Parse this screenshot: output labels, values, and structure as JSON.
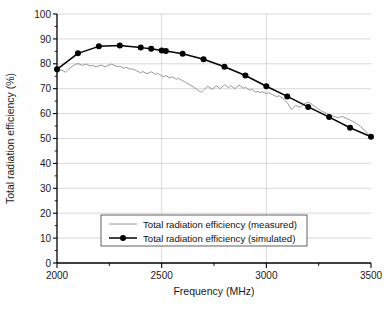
{
  "chart_data": {
    "type": "line",
    "title": "",
    "xlabel": "Frequency (MHz)",
    "ylabel": "Total radiation efficiency (%)",
    "xlim": [
      2000,
      3500
    ],
    "ylim": [
      0,
      100
    ],
    "grid": true,
    "legend_position": "lower-center",
    "x_ticks": [
      2000,
      2500,
      3000,
      3500
    ],
    "x_tick_labels": [
      "2000",
      "2500",
      "3000",
      "3500"
    ],
    "x_minor_ticks": [
      2250,
      2750,
      3250
    ],
    "y_ticks": [
      0,
      10,
      20,
      30,
      40,
      50,
      60,
      70,
      80,
      90,
      100
    ],
    "y_tick_labels": [
      "0",
      "10",
      "20",
      "30",
      "40",
      "50",
      "60",
      "70",
      "80",
      "90",
      "100"
    ],
    "series": [
      {
        "name": "Total radiation efficiency (measured)",
        "color": "#8a8a8a",
        "style": "line",
        "marker": "none",
        "x": [
          2000,
          2010,
          2020,
          2030,
          2040,
          2050,
          2060,
          2070,
          2080,
          2090,
          2100,
          2110,
          2120,
          2130,
          2140,
          2150,
          2160,
          2170,
          2180,
          2190,
          2200,
          2210,
          2220,
          2230,
          2240,
          2250,
          2260,
          2270,
          2280,
          2290,
          2300,
          2310,
          2320,
          2330,
          2340,
          2350,
          2360,
          2370,
          2380,
          2390,
          2400,
          2410,
          2420,
          2430,
          2440,
          2450,
          2460,
          2470,
          2480,
          2490,
          2500,
          2510,
          2520,
          2530,
          2540,
          2550,
          2560,
          2570,
          2580,
          2590,
          2600,
          2610,
          2620,
          2630,
          2640,
          2650,
          2660,
          2670,
          2680,
          2690,
          2700,
          2710,
          2720,
          2730,
          2740,
          2750,
          2760,
          2770,
          2780,
          2790,
          2800,
          2810,
          2820,
          2830,
          2840,
          2850,
          2860,
          2870,
          2880,
          2890,
          2900,
          2910,
          2920,
          2930,
          2940,
          2950,
          2960,
          2970,
          2980,
          2990,
          3000,
          3010,
          3020,
          3030,
          3040,
          3050,
          3060,
          3070,
          3080,
          3090,
          3100,
          3110,
          3120,
          3130,
          3140,
          3150,
          3160,
          3170,
          3180,
          3190,
          3200,
          3210,
          3220,
          3230,
          3240,
          3250,
          3260,
          3270,
          3280,
          3290,
          3300,
          3310,
          3320,
          3330,
          3340,
          3350,
          3360,
          3370,
          3380,
          3390,
          3400,
          3410,
          3420,
          3430,
          3440,
          3450,
          3460,
          3470,
          3480,
          3490,
          3500
        ],
        "values": [
          76.2,
          77.0,
          77.6,
          77.2,
          76.6,
          77.4,
          78.2,
          78.8,
          79.4,
          79.8,
          80.1,
          79.8,
          79.4,
          79.6,
          79.9,
          79.5,
          79.1,
          79.4,
          79.0,
          78.8,
          79.2,
          79.5,
          79.1,
          78.8,
          79.2,
          79.6,
          79.9,
          79.5,
          79.2,
          78.8,
          79.0,
          78.6,
          78.2,
          78.6,
          78.2,
          77.8,
          78.0,
          77.6,
          77.2,
          76.8,
          76.4,
          76.9,
          76.4,
          76.0,
          76.4,
          76.8,
          76.3,
          75.8,
          76.2,
          75.7,
          75.2,
          74.8,
          75.2,
          74.8,
          74.3,
          74.8,
          74.3,
          73.8,
          74.2,
          73.7,
          73.2,
          72.8,
          72.3,
          71.8,
          71.3,
          70.8,
          70.2,
          69.6,
          69.0,
          68.6,
          69.4,
          70.2,
          71.0,
          70.4,
          69.8,
          70.4,
          71.2,
          70.6,
          70.0,
          70.8,
          71.6,
          71.0,
          70.4,
          71.2,
          70.6,
          70.0,
          70.8,
          71.4,
          70.8,
          70.2,
          70.6,
          70.0,
          69.4,
          69.8,
          69.2,
          68.6,
          69.0,
          68.4,
          68.8,
          68.4,
          68.0,
          68.4,
          68.0,
          67.6,
          67.2,
          66.8,
          67.2,
          66.6,
          66.0,
          65.2,
          64.4,
          63.0,
          61.6,
          62.4,
          63.2,
          63.0,
          62.6,
          63.2,
          63.8,
          64.2,
          64.6,
          64.2,
          63.6,
          63.0,
          62.4,
          61.8,
          61.2,
          60.8,
          60.4,
          60.0,
          59.6,
          59.2,
          58.9,
          58.6,
          58.4,
          58.6,
          58.8,
          58.6,
          58.2,
          57.8,
          57.4,
          57.0,
          56.6,
          56.0,
          55.4,
          54.8,
          54.0,
          53.2,
          52.4,
          51.6,
          50.9
        ]
      },
      {
        "name": "Total radiation efficiency (simulated)",
        "color": "#000000",
        "style": "line",
        "marker": "circle",
        "x": [
          2000,
          2100,
          2200,
          2300,
          2400,
          2450,
          2500,
          2520,
          2600,
          2700,
          2800,
          2900,
          3000,
          3100,
          3200,
          3300,
          3400,
          3500
        ],
        "values": [
          77.8,
          84.2,
          87.0,
          87.3,
          86.5,
          86.0,
          85.3,
          85.1,
          84.0,
          81.8,
          78.8,
          75.3,
          71.0,
          66.9,
          62.7,
          58.6,
          54.3,
          50.7
        ]
      }
    ]
  },
  "legend": {
    "items": [
      {
        "label": "Total radiation efficiency (measured)",
        "marker": "line",
        "color": "#8a8a8a"
      },
      {
        "label": "Total radiation efficiency (simulated)",
        "marker": "line-circle",
        "color": "#000000"
      }
    ]
  }
}
